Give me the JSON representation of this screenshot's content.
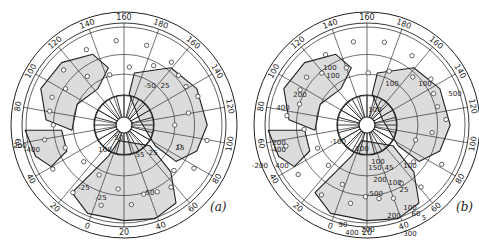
{
  "figure": {
    "panels": [
      {
        "id": "a",
        "label": "(a)",
        "center": [
          124,
          125
        ],
        "outer_radius": 113,
        "rim_labels": [
          {
            "text": "160",
            "angle": 0
          },
          {
            "text": "180",
            "angle": 20
          },
          {
            "text": "160",
            "angle": 40
          },
          {
            "text": "140",
            "angle": 60
          },
          {
            "text": "120",
            "angle": 80
          },
          {
            "text": "100",
            "angle": 100
          },
          {
            "text": "80",
            "angle": 120
          },
          {
            "text": "60",
            "angle": 140
          },
          {
            "text": "40",
            "angle": 160
          },
          {
            "text": "20",
            "angle": 180
          },
          {
            "text": "0",
            "angle": 200
          },
          {
            "text": "20",
            "angle": 220
          },
          {
            "text": "40",
            "angle": 240
          },
          {
            "text": "60",
            "angle": 260
          },
          {
            "text": "80",
            "angle": 280
          },
          {
            "text": "100",
            "angle": 300
          },
          {
            "text": "120",
            "angle": 320
          },
          {
            "text": "140",
            "angle": 340
          }
        ],
        "contour_labels": [
          {
            "text": "100",
            "x": 105,
            "y": 152
          },
          {
            "text": "50",
            "x": 119,
            "y": 140
          },
          {
            "text": "55",
            "x": 140,
            "y": 157
          },
          {
            "text": "-25",
            "x": 152,
            "y": 155
          },
          {
            "text": "25",
            "x": 180,
            "y": 150
          },
          {
            "text": "-25",
            "x": 84,
            "y": 190
          },
          {
            "text": "-25",
            "x": 101,
            "y": 200
          },
          {
            "text": "50",
            "x": 150,
            "y": 195
          },
          {
            "text": "200",
            "x": 20,
            "y": 148
          },
          {
            "text": "-400",
            "x": 32,
            "y": 152
          },
          {
            "text": "-50",
            "x": 150,
            "y": 88
          },
          {
            "text": "25",
            "x": 165,
            "y": 88
          }
        ]
      },
      {
        "id": "b",
        "label": "(b)",
        "center": [
          367,
          125
        ],
        "outer_radius": 113,
        "rim_labels": [
          {
            "text": "160",
            "angle": 0
          },
          {
            "text": "180",
            "angle": 20
          },
          {
            "text": "160",
            "angle": 40
          },
          {
            "text": "140",
            "angle": 60
          },
          {
            "text": "120",
            "angle": 80
          },
          {
            "text": "100",
            "angle": 100
          },
          {
            "text": "80",
            "angle": 120
          },
          {
            "text": "60",
            "angle": 140
          },
          {
            "text": "40",
            "angle": 160
          },
          {
            "text": "20",
            "angle": 180
          },
          {
            "text": "0",
            "angle": 200
          },
          {
            "text": "20",
            "angle": 220
          },
          {
            "text": "40",
            "angle": 240
          },
          {
            "text": "60",
            "angle": 260
          },
          {
            "text": "80",
            "angle": 280
          },
          {
            "text": "100",
            "angle": 300
          },
          {
            "text": "120",
            "angle": 320
          },
          {
            "text": "140",
            "angle": 340
          }
        ],
        "contour_labels": [
          {
            "text": "100",
            "x": 330,
            "y": 70
          },
          {
            "text": "100",
            "x": 333,
            "y": 78
          },
          {
            "text": "100",
            "x": 392,
            "y": 86
          },
          {
            "text": "100",
            "x": 425,
            "y": 86
          },
          {
            "text": "500",
            "x": 455,
            "y": 96
          },
          {
            "text": "200",
            "x": 300,
            "y": 97
          },
          {
            "text": "400",
            "x": 283,
            "y": 110
          },
          {
            "text": "100",
            "x": 375,
            "y": 112
          },
          {
            "text": "200",
            "x": 279,
            "y": 145
          },
          {
            "text": "-400",
            "x": 278,
            "y": 152
          },
          {
            "text": "-200",
            "x": 260,
            "y": 168
          },
          {
            "text": "400",
            "x": 282,
            "y": 168
          },
          {
            "text": "-100",
            "x": 338,
            "y": 144
          },
          {
            "text": "100",
            "x": 362,
            "y": 151
          },
          {
            "text": "100",
            "x": 378,
            "y": 164
          },
          {
            "text": "150",
            "x": 375,
            "y": 170
          },
          {
            "text": "45",
            "x": 389,
            "y": 170
          },
          {
            "text": "200",
            "x": 380,
            "y": 182
          },
          {
            "text": "100",
            "x": 395,
            "y": 185
          },
          {
            "text": "25",
            "x": 404,
            "y": 192
          },
          {
            "text": "-500",
            "x": 375,
            "y": 196
          },
          {
            "text": "100",
            "x": 410,
            "y": 168
          },
          {
            "text": "100",
            "x": 410,
            "y": 210
          },
          {
            "text": "60",
            "x": 416,
            "y": 216
          },
          {
            "text": "5",
            "x": 424,
            "y": 220
          },
          {
            "text": "200",
            "x": 394,
            "y": 218
          },
          {
            "text": "300",
            "x": 410,
            "y": 236
          },
          {
            "text": "400",
            "x": 352,
            "y": 235
          },
          {
            "text": "200",
            "x": 368,
            "y": 232
          },
          {
            "text": "90",
            "x": 343,
            "y": 227
          }
        ]
      }
    ]
  }
}
